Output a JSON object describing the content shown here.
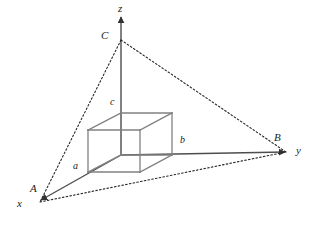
{
  "figure": {
    "type": "geometry-diagram",
    "background_color": "#ffffff",
    "axis_color": "#4d4d4d",
    "box_color": "#808080",
    "dotted_color": "#262626",
    "axes": [
      {
        "name": "x-axis",
        "label": "x",
        "label_x": 17,
        "label_y": 201,
        "tip_x": 36,
        "tip_y": 203
      },
      {
        "name": "y-axis",
        "label": "y",
        "label_x": 296,
        "label_y": 146,
        "tip_x": 290,
        "tip_y": 152
      },
      {
        "name": "z-axis",
        "label": "z",
        "label_x": 118,
        "label_y": 4,
        "tip_x": 121,
        "tip_y": 12
      }
    ],
    "points": [
      {
        "name": "A",
        "label": "A",
        "label_x": 30,
        "label_y": 185,
        "x": 40,
        "y": 202
      },
      {
        "name": "B",
        "label": "B",
        "label_x": 274,
        "label_y": 134,
        "x": 287,
        "y": 152
      },
      {
        "name": "C",
        "label": "C",
        "label_x": 101,
        "label_y": 32,
        "x": 121,
        "y": 40
      }
    ],
    "dimensions": [
      {
        "name": "a",
        "label": "a",
        "label_x": 73,
        "label_y": 163
      },
      {
        "name": "b",
        "label": "b",
        "label_x": 180,
        "label_y": 137
      },
      {
        "name": "c",
        "label": "c",
        "label_x": 110,
        "label_y": 99
      }
    ],
    "box": {
      "front_bottom_left": [
        88,
        172
      ],
      "front_bottom_right": [
        140,
        172
      ],
      "front_top_left": [
        88,
        130
      ],
      "front_top_right": [
        140,
        130
      ],
      "back_bottom_left": [
        121,
        155
      ],
      "back_bottom_right": [
        172,
        155
      ],
      "back_top_left": [
        121,
        113
      ],
      "back_top_right": [
        172,
        113
      ]
    }
  }
}
